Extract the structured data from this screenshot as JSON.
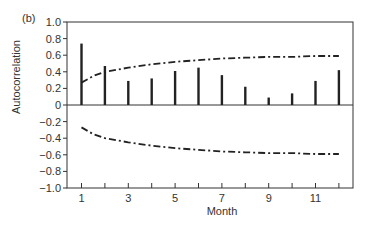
{
  "panel_label": "(b)",
  "chart_data": {
    "type": "bar",
    "title": "",
    "panel": "(b)",
    "xlabel": "Month",
    "ylabel": "Autocorrelation",
    "xlim": [
      0.4,
      12.6
    ],
    "ylim": [
      -1.0,
      1.0
    ],
    "x_ticks": [
      1,
      2,
      3,
      4,
      5,
      6,
      7,
      8,
      9,
      10,
      11,
      12
    ],
    "x_tick_labels": [
      "1",
      "",
      "3",
      "",
      "5",
      "",
      "7",
      "",
      "9",
      "",
      "11",
      ""
    ],
    "y_ticks": [
      1.0,
      0.8,
      0.6,
      0.4,
      0.2,
      0,
      -0.2,
      -0.4,
      -0.6,
      -0.8,
      -1.0
    ],
    "y_tick_labels": [
      "1.0",
      "0.8",
      "0.6",
      "0.4",
      "0.2",
      "0",
      "−0.2",
      "−0.4",
      "−0.6",
      "−0.8",
      "−1.0"
    ],
    "grid": false,
    "categories": [
      1,
      2,
      3,
      4,
      5,
      6,
      7,
      8,
      9,
      10,
      11,
      12
    ],
    "series": [
      {
        "name": "Autocorrelation",
        "type": "bar",
        "values": [
          0.74,
          0.47,
          0.29,
          0.32,
          0.41,
          0.45,
          0.36,
          0.22,
          0.09,
          0.14,
          0.29,
          0.42
        ]
      },
      {
        "name": "Upper confidence limit",
        "type": "line",
        "style": "dash-dot",
        "x": [
          1,
          1.5,
          2,
          3,
          4,
          5,
          6,
          7,
          8,
          9,
          10,
          11,
          12
        ],
        "values": [
          0.27,
          0.35,
          0.4,
          0.45,
          0.49,
          0.52,
          0.54,
          0.56,
          0.57,
          0.58,
          0.58,
          0.59,
          0.59
        ]
      },
      {
        "name": "Lower confidence limit",
        "type": "line",
        "style": "dash-dot",
        "x": [
          1,
          1.5,
          2,
          3,
          4,
          5,
          6,
          7,
          8,
          9,
          10,
          11,
          12
        ],
        "values": [
          -0.27,
          -0.35,
          -0.4,
          -0.45,
          -0.49,
          -0.52,
          -0.54,
          -0.56,
          -0.57,
          -0.58,
          -0.58,
          -0.59,
          -0.59
        ]
      }
    ]
  }
}
